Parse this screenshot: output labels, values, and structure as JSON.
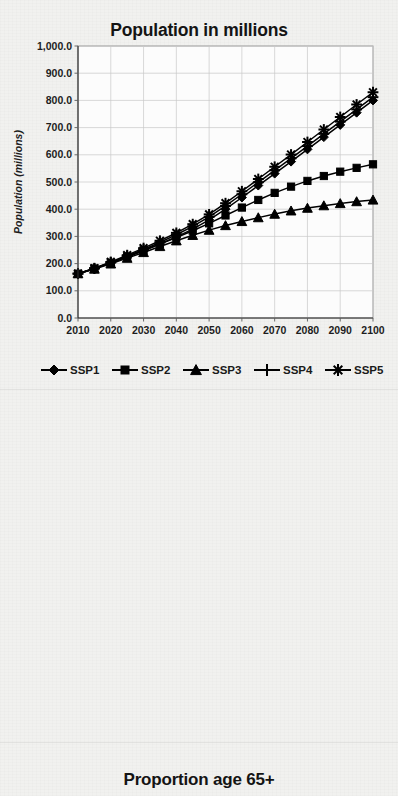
{
  "page": {
    "background_color": "#f1f1ef",
    "ink_color": "#000000"
  },
  "charts": [
    {
      "id": "population",
      "title": "Population in millions"
    },
    {
      "id": "schooling",
      "title": "Mean years of schooling, age 25+"
    },
    {
      "id": "proportion65",
      "title": "Proportion age 65+"
    }
  ],
  "legend": {
    "position": "bottom",
    "entries": [
      {
        "label": "SSP1",
        "marker": "diamond"
      },
      {
        "label": "SSP2",
        "marker": "square"
      },
      {
        "label": "SSP3",
        "marker": "triangle"
      },
      {
        "label": "SSP4",
        "marker": "plus"
      },
      {
        "label": "SSP5",
        "marker": "asterisk"
      }
    ]
  },
  "chart_data": [
    {
      "type": "line",
      "title": "Population in millions",
      "xlabel": "",
      "ylabel": "Population (millions)",
      "x": [
        2010,
        2015,
        2020,
        2025,
        2030,
        2035,
        2040,
        2045,
        2050,
        2055,
        2060,
        2065,
        2070,
        2075,
        2080,
        2085,
        2090,
        2095,
        2100
      ],
      "xticks": [
        2010,
        2020,
        2030,
        2040,
        2050,
        2060,
        2070,
        2080,
        2090,
        2100
      ],
      "xticklabels": [
        "2010",
        "2020",
        "2030",
        "2040",
        "2050",
        "2060",
        "2070",
        "2080",
        "2090",
        "2100"
      ],
      "yticks": [
        0,
        100,
        200,
        300,
        400,
        500,
        600,
        700,
        800,
        900,
        1000
      ],
      "yticklabels": [
        "0.0",
        "100.0",
        "200.0",
        "300.0",
        "400.0",
        "500.0",
        "600.0",
        "700.0",
        "800.0",
        "900.0",
        "1,000.0"
      ],
      "xlim": [
        2010,
        2100
      ],
      "ylim": [
        0,
        1000
      ],
      "grid": true,
      "legend": [
        "SSP1",
        "SSP2",
        "SSP3",
        "SSP4",
        "SSP5"
      ],
      "series": [
        {
          "name": "SSP1",
          "marker": "diamond",
          "values": [
            163,
            181,
            202,
            224,
            247,
            272,
            298,
            327,
            361,
            400,
            443,
            487,
            531,
            575,
            620,
            665,
            710,
            755,
            800
          ]
        },
        {
          "name": "SSP2",
          "marker": "square",
          "values": [
            163,
            182,
            203,
            226,
            249,
            272,
            296,
            321,
            348,
            377,
            406,
            434,
            460,
            483,
            504,
            522,
            538,
            552,
            565
          ]
        },
        {
          "name": "SSP3",
          "marker": "triangle",
          "values": [
            163,
            180,
            199,
            220,
            241,
            263,
            284,
            304,
            323,
            340,
            355,
            369,
            382,
            394,
            404,
            413,
            421,
            428,
            434
          ]
        },
        {
          "name": "SSP4",
          "marker": "plus",
          "values": [
            163,
            182,
            204,
            228,
            252,
            278,
            306,
            337,
            372,
            412,
            455,
            499,
            543,
            587,
            632,
            677,
            722,
            767,
            812
          ]
        },
        {
          "name": "SSP5",
          "marker": "asterisk",
          "values": [
            163,
            183,
            206,
            231,
            257,
            284,
            313,
            345,
            381,
            422,
            466,
            511,
            556,
            601,
            647,
            693,
            739,
            785,
            830
          ]
        }
      ]
    },
    {
      "type": "line",
      "title": "Mean years of schooling, age 25+",
      "xlabel": "",
      "ylabel": "Mean years of schooling",
      "x": [
        2010,
        2015,
        2020,
        2025,
        2030,
        2035,
        2040,
        2045,
        2050,
        2055,
        2060,
        2065,
        2070,
        2075,
        2080,
        2085,
        2090,
        2095,
        2100
      ],
      "xticks": [
        2010,
        2020,
        2030,
        2040,
        2050,
        2060,
        2070,
        2080,
        2090,
        2100
      ],
      "xticklabels": [
        "2010",
        "2020",
        "2030",
        "2040",
        "2050",
        "2060",
        "2070",
        "2080",
        "2090",
        "2100"
      ],
      "yticks": [
        0,
        2,
        4,
        6,
        8,
        10,
        12,
        14,
        16
      ],
      "yticklabels": [
        "0.0",
        "2.0",
        "4.0",
        "6.0",
        "8.0",
        "10.0",
        "12.0",
        "14.0",
        "16.0"
      ],
      "xlim": [
        2010,
        2100
      ],
      "ylim": [
        0,
        16
      ],
      "grid": true,
      "legend": [
        "SSP1",
        "SSP2",
        "SSP3",
        "SSP4",
        "SSP5"
      ],
      "series": [
        {
          "name": "SSP1",
          "marker": "diamond",
          "values": [
            6.1,
            7.1,
            8.3,
            9.4,
            10.4,
            11.3,
            12.0,
            12.6,
            13.1,
            13.5,
            13.8,
            14.1,
            14.3,
            14.5,
            14.6,
            14.7,
            14.8,
            14.85,
            14.9
          ]
        },
        {
          "name": "SSP2",
          "marker": "square",
          "values": [
            6.1,
            6.9,
            7.9,
            8.9,
            9.9,
            10.7,
            11.4,
            12.0,
            12.5,
            12.9,
            13.3,
            13.6,
            13.8,
            14.0,
            14.15,
            14.3,
            14.4,
            14.45,
            14.5
          ]
        },
        {
          "name": "SSP3",
          "marker": "triangle",
          "values": [
            6.1,
            6.6,
            7.0,
            7.4,
            7.7,
            7.9,
            8.1,
            8.25,
            8.35,
            8.45,
            8.5,
            8.55,
            8.6,
            8.62,
            8.64,
            8.66,
            8.68,
            8.69,
            8.7
          ]
        },
        {
          "name": "SSP4",
          "marker": "plus",
          "values": [
            6.1,
            6.7,
            7.2,
            7.6,
            7.9,
            8.1,
            8.3,
            8.45,
            8.55,
            8.65,
            8.7,
            8.75,
            8.8,
            8.84,
            8.87,
            8.9,
            8.93,
            8.96,
            9.0
          ]
        },
        {
          "name": "SSP5",
          "marker": "asterisk",
          "values": [
            6.1,
            7.2,
            8.4,
            9.5,
            10.5,
            11.4,
            12.1,
            12.7,
            13.2,
            13.6,
            13.9,
            14.2,
            14.4,
            14.55,
            14.65,
            14.75,
            14.8,
            14.85,
            14.9
          ]
        }
      ]
    }
  ]
}
